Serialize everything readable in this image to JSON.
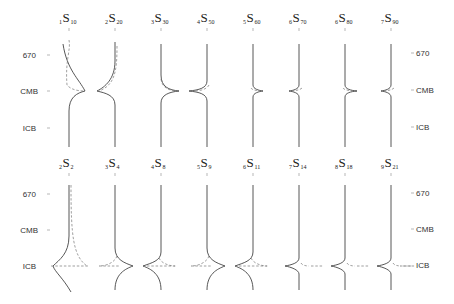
{
  "figure": {
    "depth_labels": [
      "670",
      "CMB",
      "ICB"
    ],
    "top_row": {
      "modes": [
        {
          "n": "1",
          "l": "10",
          "x": 69,
          "type": "cmb_broad_right"
        },
        {
          "n": "2",
          "l": "20",
          "x": 115,
          "type": "cmb_broad_left"
        },
        {
          "n": "3",
          "l": "30",
          "x": 161,
          "type": "cmb_right"
        },
        {
          "n": "4",
          "l": "50",
          "x": 207,
          "type": "cmb_left"
        },
        {
          "n": "5",
          "l": "60",
          "x": 253,
          "type": "cmb_narrow_left_right"
        },
        {
          "n": "6",
          "l": "70",
          "x": 299,
          "type": "cmb_narrow_left"
        },
        {
          "n": "6",
          "l": "80",
          "x": 345,
          "type": "cmb_narrow_right"
        },
        {
          "n": "7",
          "l": "90",
          "x": 391,
          "type": "cmb_narrow_left"
        }
      ]
    },
    "bottom_row": {
      "modes": [
        {
          "n": "2",
          "l": "2",
          "x": 69,
          "type": "icb_broad"
        },
        {
          "n": "3",
          "l": "4",
          "x": 115,
          "type": "icb_right"
        },
        {
          "n": "4",
          "l": "8",
          "x": 161,
          "type": "icb_left"
        },
        {
          "n": "5",
          "l": "9",
          "x": 207,
          "type": "icb_right"
        },
        {
          "n": "6",
          "l": "11",
          "x": 253,
          "type": "icb_left"
        },
        {
          "n": "7",
          "l": "14",
          "x": 299,
          "type": "icb_left_narrow"
        },
        {
          "n": "8",
          "l": "18",
          "x": 345,
          "type": "icb_left_narrow"
        },
        {
          "n": "9",
          "l": "21",
          "x": 391,
          "type": "icb_left_narrow"
        }
      ]
    },
    "legend": {
      "solid": "sensitivity kernel (solid)",
      "dashed": "sensitivity kernel (dashed)"
    }
  },
  "labels": {
    "top_670": "670",
    "top_cmb": "CMB",
    "top_icb": "ICB",
    "bot_670": "670",
    "bot_cmb": "CMB",
    "bot_icb": "ICB"
  }
}
